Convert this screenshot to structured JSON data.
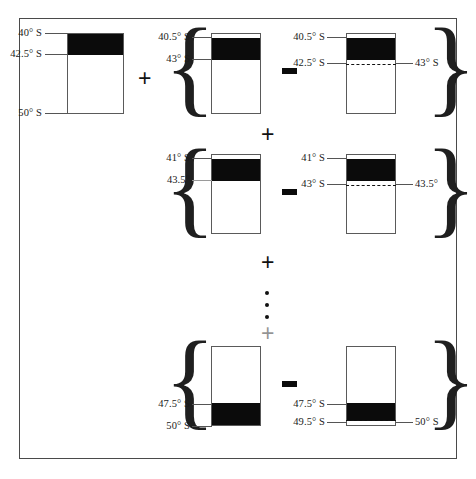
{
  "figure": {
    "colors": {
      "fill": "#0b0b0b",
      "outline": "#5a5a5a",
      "frame": "#4a4a4a",
      "background": "#ffffff"
    },
    "operators": {
      "plus": "+",
      "minus": "–",
      "ellipsis": "⋮",
      "brace_open": "{",
      "brace_close": "}"
    },
    "rows": [
      {
        "id": "row-1",
        "terms": [
          {
            "id": "row1-term1",
            "role": "result",
            "labels_left": [
              "40° S",
              "42.5° S",
              "50° S"
            ],
            "labels_right": [],
            "has_dashed": false,
            "has_top_gap": false
          },
          {
            "id": "row1-term2",
            "role": "minuend",
            "labels_left": [
              "40.5° S",
              "43° S"
            ],
            "labels_right": [],
            "has_dashed": false,
            "has_top_gap": true
          },
          {
            "id": "row1-term3",
            "role": "subtrahend",
            "labels_left": [
              "40.5° S",
              "42.5° S"
            ],
            "labels_right": [
              "43° S"
            ],
            "has_dashed": true,
            "has_top_gap": true
          }
        ]
      },
      {
        "id": "row-2",
        "terms": [
          {
            "id": "row2-term1",
            "role": "minuend",
            "labels_left": [
              "41° S",
              "43.5°"
            ],
            "labels_right": [],
            "has_dashed": false,
            "has_top_gap": true
          },
          {
            "id": "row2-term2",
            "role": "subtrahend",
            "labels_left": [
              "41° S",
              "43° S"
            ],
            "labels_right": [
              "43.5°"
            ],
            "has_dashed": true,
            "has_top_gap": true
          }
        ]
      },
      {
        "id": "row-3",
        "terms": [
          {
            "id": "row3-term1",
            "role": "minuend",
            "labels_left": [
              "47.5° S",
              "50° S"
            ],
            "labels_right": [],
            "has_dashed": false,
            "has_top_gap": false
          },
          {
            "id": "row3-term2",
            "role": "subtrahend",
            "labels_left": [
              "47.5° S",
              "49.5° S"
            ],
            "labels_right": [
              "50° S"
            ],
            "has_dashed": true,
            "has_top_gap": false
          }
        ]
      }
    ],
    "inline_operators": {
      "r1_plus": "+",
      "r1_minus": "–",
      "r2_minus": "–",
      "r3_minus": "–",
      "between_r1_r2": "+",
      "between_r2_dots": "+",
      "below_dots": "+"
    },
    "labels": {
      "r1c1_top": "40° S",
      "r1c1_mid": "42.5° S",
      "r1c1_bot": "50° S",
      "r1c2_top": "40.5° S",
      "r1c2_mid": "43° S",
      "r1c3_top": "40.5° S",
      "r1c3_mid": "42.5° S",
      "r1c3_right": "43° S",
      "r2c1_top": "41° S",
      "r2c1_mid": "43.5°",
      "r2c2_top": "41° S",
      "r2c2_mid": "43° S",
      "r2c2_right": "43.5°",
      "r3c1_top": "47.5° S",
      "r3c1_bot": "50° S",
      "r3c2_top": "47.5° S",
      "r3c2_bot": "49.5° S",
      "r3c2_right": "50° S"
    }
  }
}
